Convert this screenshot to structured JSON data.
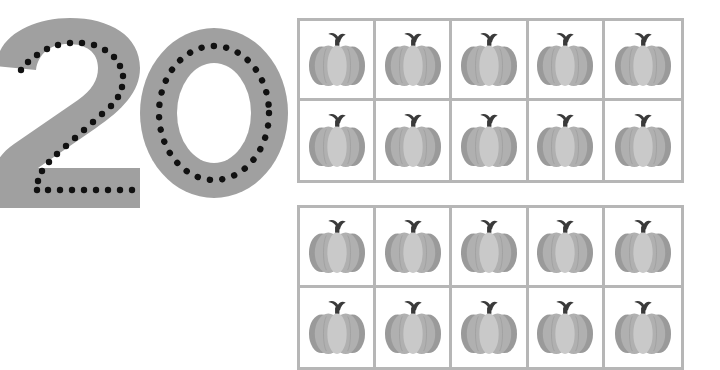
{
  "worksheet": {
    "title": "Number 20 Tracing and Counting Worksheet",
    "numeral": {
      "value": "20",
      "digits": [
        "2",
        "0"
      ],
      "style": "dotted-trace",
      "glyph_color": "#a0a0a0",
      "dot_color": "#111111",
      "aria_label": "Trace the number 20"
    },
    "grids": [
      {
        "name": "ten-frame-1",
        "label": "Ten frame 1",
        "columns": 5,
        "rows": 2,
        "count": 10,
        "border_color": "#b6b6b6",
        "cells": [
          {
            "icon": "pumpkin-icon",
            "label": "pumpkin"
          },
          {
            "icon": "pumpkin-icon",
            "label": "pumpkin"
          },
          {
            "icon": "pumpkin-icon",
            "label": "pumpkin"
          },
          {
            "icon": "pumpkin-icon",
            "label": "pumpkin"
          },
          {
            "icon": "pumpkin-icon",
            "label": "pumpkin"
          },
          {
            "icon": "pumpkin-icon",
            "label": "pumpkin"
          },
          {
            "icon": "pumpkin-icon",
            "label": "pumpkin"
          },
          {
            "icon": "pumpkin-icon",
            "label": "pumpkin"
          },
          {
            "icon": "pumpkin-icon",
            "label": "pumpkin"
          },
          {
            "icon": "pumpkin-icon",
            "label": "pumpkin"
          }
        ]
      },
      {
        "name": "ten-frame-2",
        "label": "Ten frame 2",
        "columns": 5,
        "rows": 2,
        "count": 10,
        "border_color": "#b6b6b6",
        "cells": [
          {
            "icon": "pumpkin-icon",
            "label": "pumpkin"
          },
          {
            "icon": "pumpkin-icon",
            "label": "pumpkin"
          },
          {
            "icon": "pumpkin-icon",
            "label": "pumpkin"
          },
          {
            "icon": "pumpkin-icon",
            "label": "pumpkin"
          },
          {
            "icon": "pumpkin-icon",
            "label": "pumpkin"
          },
          {
            "icon": "pumpkin-icon",
            "label": "pumpkin"
          },
          {
            "icon": "pumpkin-icon",
            "label": "pumpkin"
          },
          {
            "icon": "pumpkin-icon",
            "label": "pumpkin"
          },
          {
            "icon": "pumpkin-icon",
            "label": "pumpkin"
          },
          {
            "icon": "pumpkin-icon",
            "label": "pumpkin"
          }
        ]
      }
    ],
    "total_objects": 20,
    "colors": {
      "background": "#ffffff",
      "numeral_gray": "#a0a0a0",
      "trace_dot": "#111111",
      "grid_line": "#b6b6b6",
      "pumpkin_light": "#c9c9c9",
      "pumpkin_mid": "#b0b0b0",
      "pumpkin_dark": "#9a9a9a",
      "pumpkin_stem": "#3a3a3a"
    }
  }
}
